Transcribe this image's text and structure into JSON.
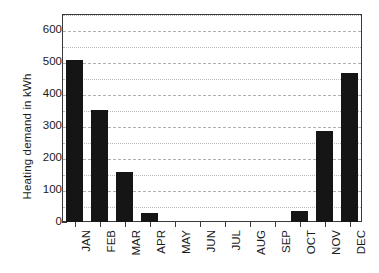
{
  "chart_data": {
    "type": "bar",
    "title": "",
    "subtitle": "",
    "xlabel": "",
    "ylabel": "Heating demand in kWh",
    "categories": [
      "JAN",
      "FEB",
      "MAR",
      "APR",
      "MAY",
      "JUN",
      "JUL",
      "AUG",
      "SEP",
      "OCT",
      "NOV",
      "DEC"
    ],
    "values": [
      505,
      350,
      155,
      27,
      0,
      0,
      0,
      0,
      0,
      35,
      283,
      465
    ],
    "ylim": [
      0,
      650
    ],
    "y_major_ticks": [
      0,
      100,
      200,
      300,
      400,
      500,
      600
    ],
    "y_minor_ticks": [
      50,
      150,
      250,
      350,
      450,
      550,
      600
    ],
    "y_tick_labels": [
      "0",
      "100",
      "200",
      "300",
      "400",
      "500",
      "600"
    ],
    "grid": true,
    "grid_axis": "y",
    "grid_interval": 50,
    "legend": false,
    "legend_position": "none",
    "bar_color": "#151515",
    "grid_color": "#b9b9b9",
    "frame_color": "#3a3a3a",
    "background_color": "#ffffff",
    "x_tick_label_rotation": 90,
    "annotations": []
  }
}
